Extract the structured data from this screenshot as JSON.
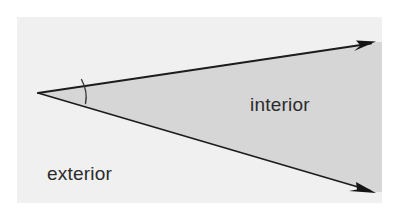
{
  "figure": {
    "type": "geometry-diagram",
    "canvas": {
      "width": 403,
      "height": 213
    },
    "panel": {
      "name": "figure-background-panel",
      "x": 17,
      "y": 17,
      "width": 365,
      "height": 186,
      "fill": "#f0f0f0"
    },
    "colors": {
      "page_background": "#ffffff",
      "panel_background": "#f0f0f0",
      "interior_fill": "#d6d6d6",
      "ray_stroke": "#1c1c1c",
      "arc_stroke": "#3a3a3a",
      "label_text": "#2b2b2b"
    },
    "vertex": {
      "name": "angle-vertex",
      "x": 38,
      "y": 93
    },
    "rays": [
      {
        "name": "upper-ray",
        "from_x": 38,
        "from_y": 93,
        "to_x": 374,
        "to_y": 42,
        "arrowhead": "true",
        "stroke_width": 1.8
      },
      {
        "name": "lower-ray",
        "from_x": 38,
        "from_y": 93,
        "to_x": 374,
        "to_y": 192,
        "arrowhead": "true",
        "stroke_width": 1.8
      }
    ],
    "angle_arc": {
      "name": "angle-arc",
      "start_x": 81,
      "start_y": 80,
      "end_x": 86,
      "end_y": 103,
      "radius": 46,
      "stroke_width": 1.4
    },
    "interior_region": {
      "name": "interior-shaded-region",
      "fill": "#d6d6d6",
      "points": "38,93 374,42 382,42 382,192 374,192"
    },
    "labels": {
      "interior": {
        "text": "interior",
        "x": 250,
        "y": 111,
        "font_size": 19
      },
      "exterior": {
        "text": "exterior",
        "x": 47,
        "y": 180,
        "font_size": 19
      }
    }
  }
}
